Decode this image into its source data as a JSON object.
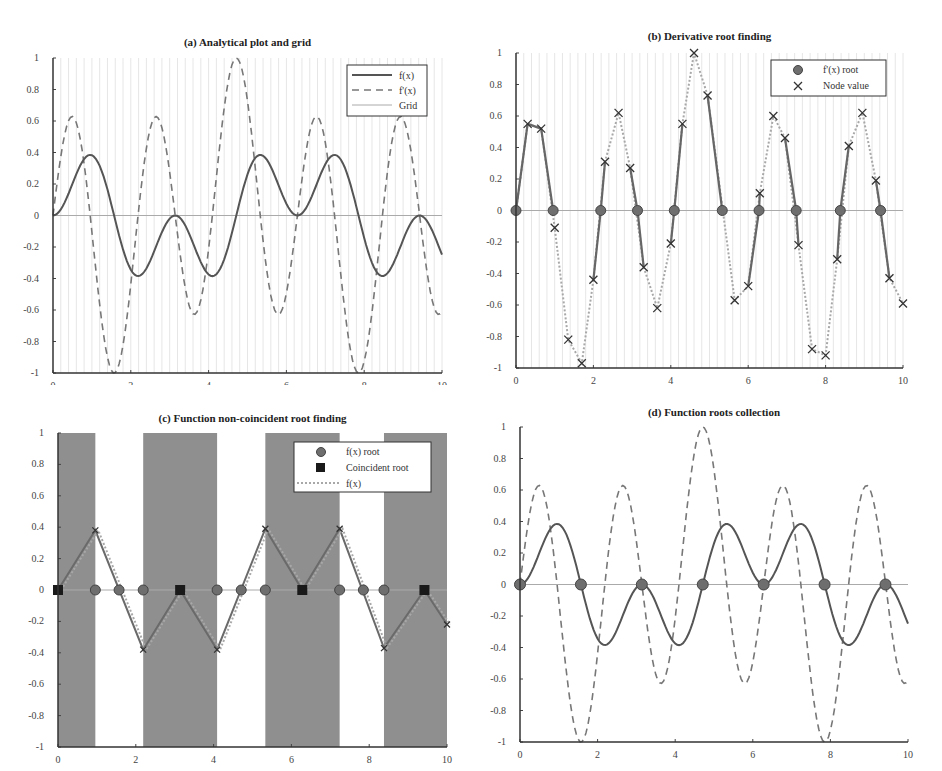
{
  "chart_data": [
    {
      "id": "a",
      "type": "line",
      "title": "(a) Analytical plot and grid",
      "xlabel": "",
      "ylabel": "",
      "xlim": [
        0,
        10
      ],
      "ylim": [
        -1,
        1
      ],
      "xticks": [
        "0",
        "2",
        "4",
        "6",
        "8",
        "10"
      ],
      "yticks": [
        "1",
        "0.8",
        "0.6",
        "0.4",
        "0.2",
        "0",
        "-0.2",
        "-0.4",
        "-0.6",
        "-0.8",
        "-1"
      ],
      "grid": "vertical light lines every 0.2",
      "legend": {
        "position": "upper right",
        "entries": [
          "f(x)",
          "f'(x)",
          "Grid"
        ]
      },
      "series": [
        {
          "name": "f(x)",
          "style": "solid"
        },
        {
          "name": "f'(x)",
          "style": "dashed"
        },
        {
          "name": "Grid",
          "style": "thin light line at y=0"
        }
      ]
    },
    {
      "id": "b",
      "type": "scatter",
      "title": "(b) Derivative root finding",
      "xlim": [
        0,
        10
      ],
      "ylim": [
        -1,
        1
      ],
      "xticks": [
        "0",
        "2",
        "4",
        "6",
        "8",
        "10"
      ],
      "yticks": [
        "1",
        "0.8",
        "0.6",
        "0.4",
        "0.2",
        "0",
        "-0.2",
        "-0.4",
        "-0.6",
        "-0.8",
        "-1"
      ],
      "legend": {
        "position": "upper right",
        "entries": [
          "f'(x) root",
          "Node value"
        ]
      },
      "node_values": {
        "x": [
          0.3,
          0.65,
          1.0,
          1.35,
          1.7,
          2.0,
          2.3,
          2.65,
          2.95,
          3.3,
          3.65,
          4.0,
          4.3,
          4.6,
          4.95,
          5.65,
          6.0,
          6.3,
          6.65,
          6.95,
          7.3,
          7.65,
          8.0,
          8.3,
          8.6,
          8.95,
          9.3,
          9.65,
          10.0
        ],
        "y": [
          0.55,
          0.52,
          -0.11,
          -0.82,
          -0.97,
          -0.44,
          0.31,
          0.62,
          0.27,
          -0.36,
          -0.62,
          -0.21,
          0.55,
          1.0,
          0.73,
          -0.57,
          -0.48,
          0.11,
          0.6,
          0.46,
          -0.22,
          -0.88,
          -0.92,
          -0.31,
          0.41,
          0.62,
          0.19,
          -0.43,
          -0.59
        ]
      },
      "roots": {
        "x": [
          0,
          0.96,
          2.19,
          3.14,
          4.09,
          5.33,
          6.28,
          7.24,
          8.38,
          9.42
        ],
        "y": [
          0,
          0,
          0,
          0,
          0,
          0,
          0,
          0,
          0,
          0
        ]
      }
    },
    {
      "id": "c",
      "type": "scatter",
      "title": "(c) Function non-coincident root finding",
      "xlim": [
        0,
        10
      ],
      "ylim": [
        -1,
        1
      ],
      "xticks": [
        "0",
        "2",
        "4",
        "6",
        "8",
        "10"
      ],
      "yticks": [
        "1",
        "0.8",
        "0.6",
        "0.4",
        "0.2",
        "0",
        "-0.2",
        "-0.4",
        "-0.6",
        "-0.8",
        "-1"
      ],
      "shaded_bands": [
        [
          0,
          0.96
        ],
        [
          2.19,
          4.09
        ],
        [
          5.33,
          7.24
        ],
        [
          8.38,
          10
        ]
      ],
      "legend": {
        "position": "upper right",
        "entries": [
          "f(x) root",
          "Coincident root",
          "f(x)"
        ]
      },
      "polyline": {
        "x": [
          0,
          0.96,
          2.19,
          3.14,
          4.09,
          5.33,
          6.28,
          7.24,
          8.38,
          9.42,
          10
        ],
        "y": [
          0,
          0.38,
          -0.38,
          0,
          -0.38,
          0.39,
          0,
          0.39,
          -0.37,
          0,
          -0.22
        ]
      },
      "fx_roots": {
        "x": [
          0.96,
          1.57,
          2.19,
          4.09,
          4.71,
          5.33,
          7.24,
          7.85,
          8.38
        ]
      },
      "coincident_roots": {
        "x": [
          0,
          3.14,
          6.28,
          9.42
        ]
      }
    },
    {
      "id": "d",
      "type": "line",
      "title": "(d) Function roots collection",
      "xlim": [
        0,
        10
      ],
      "ylim": [
        -1,
        1
      ],
      "xticks": [
        "0",
        "2",
        "4",
        "6",
        "8",
        "10"
      ],
      "yticks": [
        "1",
        "0.8",
        "0.6",
        "0.4",
        "0.2",
        "0",
        "-0.2",
        "-0.4",
        "-0.6",
        "-0.8",
        "-1"
      ],
      "series": [
        {
          "name": "f(x)",
          "style": "solid"
        },
        {
          "name": "f'(x)",
          "style": "dashed"
        }
      ],
      "roots": {
        "x": [
          0,
          1.57,
          3.14,
          4.71,
          6.28,
          7.85,
          9.42
        ]
      }
    }
  ],
  "curves": {
    "x": [
      0,
      0.2,
      0.4,
      0.6,
      0.8,
      1.0,
      1.2,
      1.4,
      1.6,
      1.8,
      2.0,
      2.2,
      2.4,
      2.6,
      2.8,
      3.0,
      3.2,
      3.4,
      3.6,
      3.8,
      4.0,
      4.2,
      4.4,
      4.6,
      4.8,
      5.0,
      5.2,
      5.4,
      5.6,
      5.8,
      6.0,
      6.2,
      6.4,
      6.6,
      6.8,
      7.0,
      7.2,
      7.4,
      7.6,
      7.8,
      8.0,
      8.2,
      8.4,
      8.6,
      8.8,
      9.0,
      9.2,
      9.4,
      9.6,
      9.8,
      10.0
    ],
    "f": [
      0,
      0.039,
      0.14,
      0.263,
      0.358,
      0.383,
      0.315,
      0.16,
      -0.028,
      -0.21,
      -0.344,
      -0.385,
      -0.334,
      -0.222,
      -0.093,
      -0.02,
      0.0,
      -0.064,
      -0.174,
      -0.285,
      -0.373,
      -0.385,
      -0.317,
      -0.113,
      0.084,
      0.26,
      0.366,
      0.384,
      0.331,
      0.183,
      0.074,
      0.007,
      0.013,
      0.093,
      0.212,
      0.397,
      0.377,
      0.287,
      0.063,
      -0.102,
      -0.142,
      -0.333,
      -0.38,
      -0.369,
      -0.254,
      -0.154,
      -0.038,
      0.0,
      -0.021,
      -0.129,
      -0.261
    ],
    "df": [
      0,
      0.563,
      0.611,
      0.516,
      0.158,
      -0.275,
      -0.662,
      -0.904,
      -0.996,
      -0.781,
      -0.355,
      0.143,
      0.555,
      0.634,
      0.482,
      0.213,
      -0.052,
      -0.292,
      -0.528,
      -0.618,
      -0.41,
      0.04,
      0.528,
      0.987,
      0.903,
      0.455,
      0.026,
      -0.351,
      -0.596,
      -0.536,
      -0.125,
      0.228,
      0.487,
      0.635,
      0.576,
      0.206,
      -0.2,
      -0.571,
      -0.894,
      -0.994,
      -0.922,
      -0.54,
      0.0,
      0.476,
      0.629,
      0.62,
      0.37,
      0.0,
      -0.256,
      -0.457,
      -0.574
    ]
  },
  "legend_labels": {
    "a": [
      "f(x)",
      "f'(x)",
      "Grid"
    ],
    "b": [
      "f'(x) root",
      "Node value"
    ],
    "c": [
      "f(x) root",
      "Coincident root",
      "f(x)"
    ]
  },
  "titles": {
    "a": "(a) Analytical plot and grid",
    "b": "(b) Derivative root finding",
    "c": "(c) Function non-coincident root finding",
    "d": "(d) Function roots collection"
  },
  "colors": {
    "curve": "#555555",
    "dashed": "#777777",
    "grid": "#e6e6e6",
    "zero_line": "#aaaaaa",
    "band": "#8f8f8f",
    "root_marker": "#6e6e6e",
    "coincident_marker": "#1a1a1a",
    "dotted": "#a8a8a8"
  }
}
